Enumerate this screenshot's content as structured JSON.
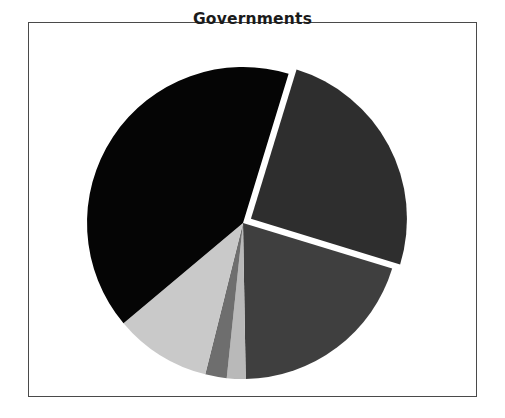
{
  "chart_data": {
    "type": "pie",
    "title": "Governments",
    "xlabel": "",
    "ylabel": "",
    "legend": "none",
    "grid": false,
    "labels": [
      "Slice 1",
      "Slice 2",
      "Slice 3",
      "Slice 4",
      "Slice 5",
      "Slice 6"
    ],
    "values": [
      25,
      20,
      2,
      2,
      10,
      41
    ],
    "percentages": [
      "25%",
      "20%",
      "2%",
      "2%",
      "10%",
      "41%"
    ],
    "colors": [
      "#2e2e2e",
      "#3f3f3f",
      "#b9b9b9",
      "#6e6e6e",
      "#c9c9c9",
      "#050505"
    ],
    "start_angle_deg": -73,
    "direction": "clockwise",
    "exploded_slices": [
      0
    ],
    "explode_offset_px": 9,
    "slice_angles_deg": [
      {
        "start": -73,
        "end": 17
      },
      {
        "start": 17,
        "end": 89
      },
      {
        "start": 89,
        "end": 96
      },
      {
        "start": 96,
        "end": 104
      },
      {
        "start": 104,
        "end": 140
      },
      {
        "start": 140,
        "end": 287
      }
    ]
  },
  "figure": {
    "title": "Governments",
    "frame_color": "#4a4a4a",
    "background": "#ffffff",
    "center_x": 243,
    "center_y": 223,
    "radius": 156
  }
}
